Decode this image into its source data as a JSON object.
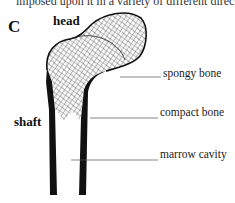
{
  "caption_fragment": "imposed upon it in a variety of different directions.",
  "panel_letter": "C",
  "labels": {
    "head": "head",
    "shaft": "shaft",
    "spongy_bone": "spongy bone",
    "compact_bone": "compact bone",
    "marrow_cavity": "marrow cavity"
  }
}
